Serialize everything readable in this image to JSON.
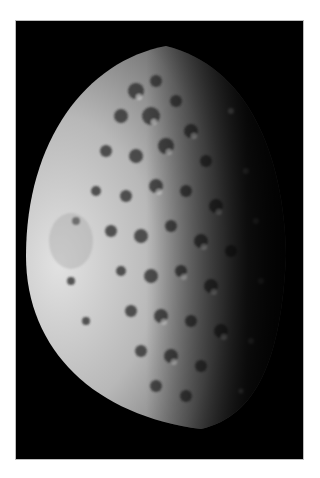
{
  "image": {
    "subject": "cratered moon, half-illuminated",
    "background_color": "#ffffff",
    "frame_color": "#000000",
    "lit_color": "#d8d8d8",
    "shadow_color": "#000000"
  }
}
